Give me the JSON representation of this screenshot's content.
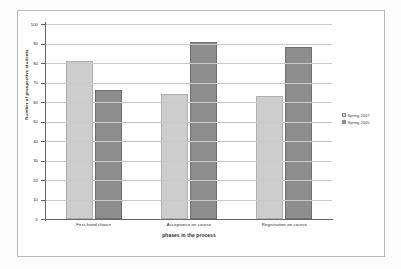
{
  "chart_data": {
    "type": "bar",
    "title": "",
    "xlabel": "phases in the process",
    "ylabel": "Number of prospective students",
    "categories": [
      "First-hand choice",
      "Acceptance on course",
      "Registration on course"
    ],
    "series": [
      {
        "name": "Spring 2007",
        "color": "#cdcdcd",
        "values": [
          81,
          64,
          63
        ]
      },
      {
        "name": "Spring 2005",
        "color": "#8d8d8d",
        "values": [
          66,
          91,
          88
        ]
      }
    ],
    "ylim": [
      0,
      100
    ],
    "yticks": [
      0,
      10,
      20,
      30,
      40,
      50,
      60,
      70,
      80,
      90,
      100
    ],
    "ytick_labels": [
      "0",
      "10",
      "20",
      "30",
      "40",
      "50",
      "60",
      "70",
      "80",
      "90",
      "100"
    ],
    "grid": true,
    "legend_position": "right"
  }
}
